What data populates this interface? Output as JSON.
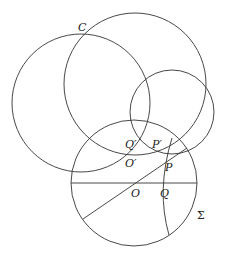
{
  "figure": {
    "circles": [
      {
        "id": "C",
        "cx": 81,
        "cy": 103,
        "r": 69
      },
      {
        "id": "large",
        "cx": 135,
        "cy": 84,
        "r": 71
      },
      {
        "id": "small",
        "cx": 172,
        "cy": 112,
        "r": 42
      },
      {
        "id": "Sigma",
        "cx": 134,
        "cy": 183,
        "r": 63
      }
    ],
    "lines": [
      {
        "id": "diameter",
        "x1": 71,
        "y1": 183,
        "x2": 197,
        "y2": 183
      },
      {
        "id": "chord-through-O",
        "x1": 83,
        "y1": 219,
        "x2": 187,
        "y2": 148
      }
    ],
    "arc": {
      "id": "arc-through-Q",
      "d": "M 172 138 Q 156 190 169 235"
    },
    "labels": [
      {
        "id": "C",
        "text": "C",
        "x": 78,
        "y": 31
      },
      {
        "id": "Q-prime",
        "text": "Q′",
        "x": 125,
        "y": 148
      },
      {
        "id": "P-prime",
        "text": "P′",
        "x": 152,
        "y": 148
      },
      {
        "id": "O-prime",
        "text": "O′",
        "x": 125,
        "y": 167
      },
      {
        "id": "P",
        "text": "P",
        "x": 165,
        "y": 171
      },
      {
        "id": "O",
        "text": "O",
        "x": 131,
        "y": 197
      },
      {
        "id": "Q",
        "text": "Q",
        "x": 160,
        "y": 197
      },
      {
        "id": "Sigma",
        "text": "Σ",
        "x": 197,
        "y": 219
      }
    ]
  }
}
